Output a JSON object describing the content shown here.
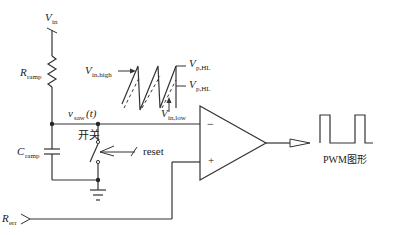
{
  "diagram": {
    "labels": {
      "vin_main": "V",
      "vin_main_sub": "in",
      "r_ramp": "R",
      "r_ramp_sub": "ramp",
      "c_ramp": "C",
      "c_ramp_sub": "ramp",
      "vsaw": "v",
      "vsaw_sub": "saw",
      "vsaw_arg": "(t)",
      "switch": "开关",
      "reset": "reset",
      "r_err": "R",
      "r_err_sub": "err",
      "vin_high": "V",
      "vin_high_sub": "in,high",
      "vin_low": "V",
      "vin_low_sub": "in,low",
      "vp_hl_1": "V",
      "vp_hl_1_sub": "p,HL",
      "vp_hl_2": "V",
      "vp_hl_2_sub": "p,HL",
      "opamp_minus": "−",
      "opamp_plus": "+",
      "pwm_label": "PWM图形"
    },
    "colors": {
      "line": "#333333",
      "background": "#ffffff"
    }
  }
}
